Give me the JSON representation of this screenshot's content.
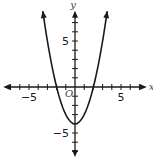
{
  "chart_data": {
    "type": "line",
    "title": "",
    "xlabel": "x",
    "ylabel": "y",
    "origin_label": "O",
    "xlim": [
      -7.8,
      7.8
    ],
    "ylim": [
      -7.6,
      8.3
    ],
    "xticks": [
      -7,
      -6,
      -5,
      -4,
      -3,
      -2,
      -1,
      1,
      2,
      3,
      4,
      5,
      6,
      7
    ],
    "yticks": [
      -7,
      -6,
      -5,
      -4,
      -3,
      -2,
      -1,
      1,
      2,
      3,
      4,
      5,
      6,
      7
    ],
    "xtick_labels": [
      {
        "value": -5,
        "text": "−5"
      },
      {
        "value": 5,
        "text": "5"
      }
    ],
    "ytick_labels": [
      {
        "value": 5,
        "text": "5"
      },
      {
        "value": -5,
        "text": "−5"
      }
    ],
    "grid": false,
    "series": [
      {
        "name": "parabola",
        "equation": "y = x^2 - 4",
        "x_range": [
          -3.5,
          3.5
        ],
        "vertex": [
          0,
          -4
        ],
        "x_intercepts": [
          -2,
          2
        ],
        "y_intercept": -4,
        "color": "#1a1a1a"
      }
    ]
  }
}
